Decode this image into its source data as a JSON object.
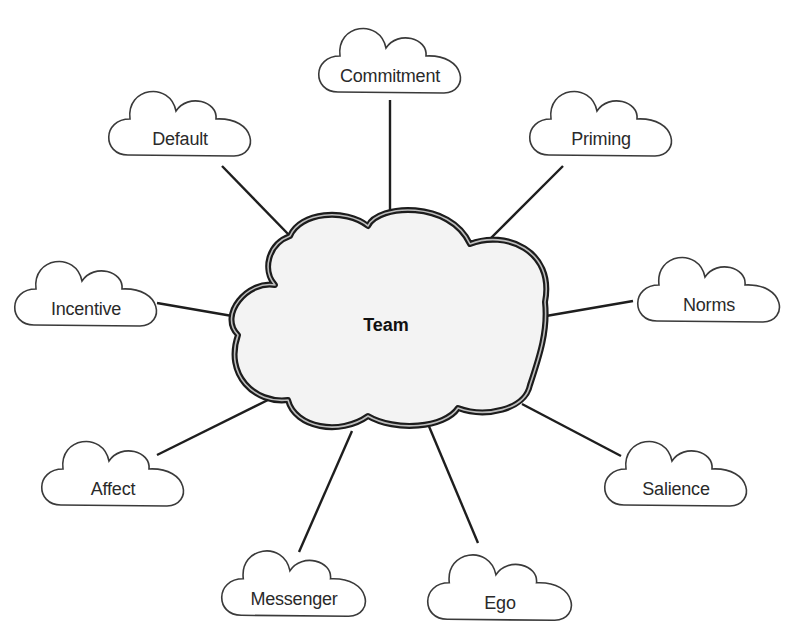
{
  "diagram": {
    "type": "mind-map",
    "center": {
      "label": "Team",
      "x": 386,
      "y": 325
    },
    "nodes": [
      {
        "id": "commitment",
        "label": "Commitment",
        "cx": 390,
        "cy": 76,
        "w": 148,
        "line": [
          390,
          100,
          390,
          214
        ]
      },
      {
        "id": "default",
        "label": "Default",
        "cx": 180,
        "cy": 139,
        "w": 148,
        "line": [
          222,
          166,
          290,
          236
        ]
      },
      {
        "id": "priming",
        "label": "Priming",
        "cx": 601,
        "cy": 139,
        "w": 148,
        "line": [
          563,
          166,
          478,
          251
        ]
      },
      {
        "id": "incentive",
        "label": "Incentive",
        "cx": 86,
        "cy": 309,
        "w": 148,
        "line": [
          157,
          303,
          238,
          317
        ]
      },
      {
        "id": "norms",
        "label": "Norms",
        "cx": 709,
        "cy": 305,
        "w": 148,
        "line": [
          633,
          301,
          546,
          316
        ]
      },
      {
        "id": "affect",
        "label": "Affect",
        "cx": 113,
        "cy": 489,
        "w": 148,
        "line": [
          157,
          455,
          272,
          398
        ]
      },
      {
        "id": "salience",
        "label": "Salience",
        "cx": 676,
        "cy": 489,
        "w": 148,
        "line": [
          621,
          456,
          522,
          404
        ]
      },
      {
        "id": "messenger",
        "label": "Messenger",
        "cx": 294,
        "cy": 599,
        "w": 150,
        "line": [
          299,
          552,
          352,
          431
        ]
      },
      {
        "id": "ego",
        "label": "Ego",
        "cx": 500,
        "cy": 603,
        "w": 150,
        "line": [
          478,
          543,
          428,
          424
        ]
      }
    ]
  }
}
